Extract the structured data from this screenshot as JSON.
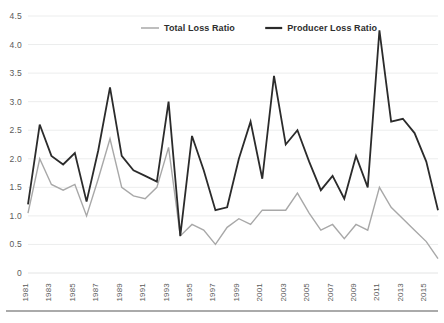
{
  "chart_data": {
    "type": "line",
    "title": "",
    "xlabel": "",
    "ylabel": "",
    "ylim": [
      0,
      4.5
    ],
    "ytick_step": 0.5,
    "grid": true,
    "legend_position": "top-center",
    "ytick_labels": [
      "4.5",
      "4.0",
      "3.5",
      "3.0",
      "2.5",
      "2.0",
      "1.5",
      "1.0",
      "0.5",
      "0"
    ],
    "ytick_values": [
      4.5,
      4.0,
      3.5,
      3.0,
      2.5,
      2.0,
      1.5,
      1.0,
      0.5,
      0
    ],
    "xtick_labels": [
      "1981",
      "1983",
      "1985",
      "1987",
      "1989",
      "1991",
      "1993",
      "1995",
      "1997",
      "1999",
      "2001",
      "2003",
      "2005",
      "2007",
      "2009",
      "2011",
      "2013",
      "2015"
    ],
    "x": [
      1981,
      1982,
      1983,
      1984,
      1985,
      1986,
      1987,
      1988,
      1989,
      1990,
      1991,
      1992,
      1993,
      1994,
      1995,
      1996,
      1997,
      1998,
      1999,
      2000,
      2001,
      2002,
      2003,
      2004,
      2005,
      2006,
      2007,
      2008,
      2009,
      2010,
      2011,
      2012,
      2013,
      2014,
      2015,
      2016
    ],
    "series": [
      {
        "name": "Total Loss Ratio",
        "color": "#a8a8a8",
        "values": [
          1.05,
          2.0,
          1.55,
          1.45,
          1.55,
          1.0,
          1.65,
          2.35,
          1.5,
          1.35,
          1.3,
          1.5,
          2.2,
          0.65,
          0.85,
          0.75,
          0.5,
          0.8,
          0.95,
          0.85,
          1.1,
          1.1,
          1.1,
          1.4,
          1.05,
          0.75,
          0.85,
          0.6,
          0.85,
          0.75,
          1.5,
          1.15,
          0.95,
          0.75,
          0.55,
          0.25
        ]
      },
      {
        "name": "Producer Loss Ratio",
        "color": "#2b2b2b",
        "values": [
          1.2,
          2.6,
          2.05,
          1.9,
          2.1,
          1.25,
          2.15,
          3.25,
          2.05,
          1.8,
          1.7,
          1.6,
          3.0,
          0.65,
          2.4,
          1.8,
          1.1,
          1.15,
          2.0,
          2.65,
          1.65,
          3.45,
          2.25,
          2.5,
          1.95,
          1.45,
          1.7,
          1.3,
          2.05,
          1.5,
          4.25,
          2.65,
          2.7,
          2.45,
          1.95,
          1.1
        ]
      }
    ]
  },
  "legend": {
    "items": [
      {
        "label": "Total Loss Ratio",
        "color": "#a8a8a8"
      },
      {
        "label": "Producer Loss Ratio",
        "color": "#2b2b2b"
      }
    ]
  }
}
